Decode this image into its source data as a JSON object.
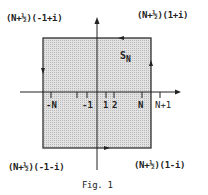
{
  "figure": {
    "caption": "Fig. 1",
    "region_label": "S",
    "region_subscript": "N",
    "corners": {
      "top_left": "(N+½)(-1+i)",
      "top_right": "(N+½)(1+i)",
      "bottom_left": "(N+½)(-1-i)",
      "bottom_right": "(N+½)(1-i)"
    },
    "ticks": [
      "-N",
      "-1",
      "1",
      "2",
      "N",
      "N+1"
    ],
    "colors": {
      "fill": "#cfcfcf",
      "stroke": "#222222"
    }
  }
}
